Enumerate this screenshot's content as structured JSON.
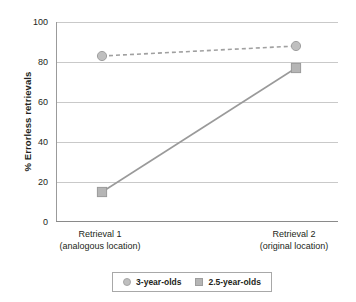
{
  "chart_data": {
    "type": "line",
    "title": "",
    "xlabel": "",
    "ylabel": "% Errorless retrievals",
    "ylim": [
      0,
      100
    ],
    "yticks": [
      0,
      20,
      40,
      60,
      80,
      100
    ],
    "grid": "horizontal",
    "legend_position": "bottom",
    "categories": [
      "Retrieval 1",
      "Retrieval 2"
    ],
    "category_sublabels": [
      "(analogous location)",
      "(original location)"
    ],
    "series": [
      {
        "name": "3-year-olds",
        "values": [
          83,
          88
        ],
        "marker": "circle",
        "linestyle": "dashed",
        "color": "#bfbfbf",
        "line_color": "#a0a0a0"
      },
      {
        "name": "2.5-year-olds",
        "values": [
          15,
          77
        ],
        "marker": "square",
        "linestyle": "solid",
        "color": "#b5b5b5",
        "line_color": "#9a9a9a"
      }
    ]
  },
  "axis": {
    "y_title": "% Errorless retrievals",
    "y_tick_labels": [
      "100",
      "80",
      "60",
      "40",
      "20",
      "0"
    ],
    "x_labels": [
      {
        "line1": "Retrieval 1",
        "line2": "(analogous location)"
      },
      {
        "line1": "Retrieval 2",
        "line2": "(original location)"
      }
    ]
  },
  "legend": {
    "entries": [
      {
        "label": "3-year-olds",
        "marker": "circle-marker-icon"
      },
      {
        "label": "2.5-year-olds",
        "marker": "square-marker-icon"
      }
    ]
  },
  "colors": {
    "gridline": "#c9c9c9",
    "axis": "#8a8a8a",
    "text": "#231f20",
    "series_gray": "#b5b5b5"
  }
}
